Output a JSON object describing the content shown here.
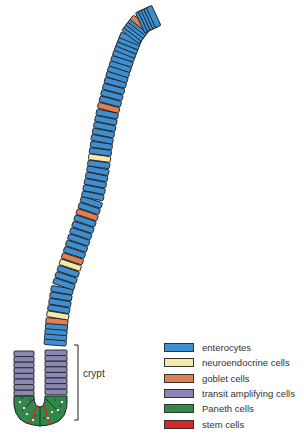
{
  "colors": {
    "enterocyte": "#3d8fd1",
    "neuroendocrine": "#f4eaa8",
    "goblet": "#e07f4f",
    "transit": "#8a88b3",
    "paneth": "#2f8a4a",
    "stem": "#d6262a",
    "outline": "#222222"
  },
  "crypt_label": "crypt",
  "legend": [
    {
      "label": "enterocytes",
      "color": "#3d8fd1"
    },
    {
      "label": "neuroendocrine cells",
      "color": "#f4eaa8"
    },
    {
      "label": "goblet cells",
      "color": "#e07f4f"
    },
    {
      "label": "transit amplifying cells",
      "color": "#8a88b3"
    },
    {
      "label": "Paneth cells",
      "color": "#2f8a4a"
    },
    {
      "label": "stem cells",
      "color": "#d6262a"
    }
  ]
}
